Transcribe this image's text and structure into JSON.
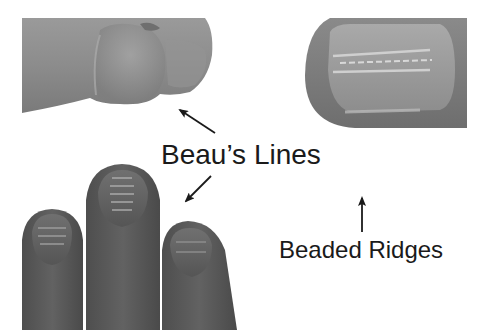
{
  "figure": {
    "labels": {
      "beaus_lines": "Beau’s Lines",
      "beaded_ridges": "Beaded Ridges"
    },
    "panels": [
      {
        "id": "top-left",
        "description": "thumb tip side view showing transverse depression (Beau's line)"
      },
      {
        "id": "top-right",
        "description": "fingernail with longitudinal beaded ridges"
      },
      {
        "id": "bottom-left",
        "description": "three fingertips with transverse Beau's lines on nails"
      }
    ],
    "arrows": [
      {
        "label": "beaus_lines",
        "direction": "up-left",
        "target": "top-left"
      },
      {
        "label": "beaus_lines",
        "direction": "down-left",
        "target": "bottom-left"
      },
      {
        "label": "beaded_ridges",
        "direction": "up",
        "target": "top-right"
      }
    ],
    "colors": {
      "background": "#ffffff",
      "text": "#1a1a1a",
      "skin_light": "#8c8c8c",
      "skin_dark": "#5a5a5a",
      "nail_highlight": "#b5b5b5"
    }
  }
}
